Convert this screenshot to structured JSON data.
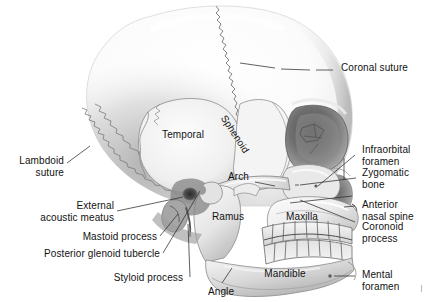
{
  "figure": {
    "background_color": "#ffffff",
    "ink_color": "#121212",
    "bone_light": "#fbfbfb",
    "bone_mid": "#d9d9d9",
    "bone_shadow": "#9a9a9a",
    "bone_dark": "#4a4a4a",
    "suture_color": "#6e6e6e"
  },
  "labels": {
    "coronal_suture": "Coronal suture",
    "temporal": "Temporal",
    "sphenoid": "Sphenoid",
    "arch": "Arch",
    "lambdoid_suture": "Lambdoid\nsuture",
    "external_acoustic_meatus": "External\nacoustic meatus",
    "mastoid_process": "Mastoid process",
    "posterior_glenoid_tubercle": "Posterior glenoid tubercle",
    "styloid_process": "Styloid process",
    "angle": "Angle",
    "ramus": "Ramus",
    "maxilla": "Maxilla",
    "mandible": "Mandible",
    "infraorbital_foramen": "Infraorbital\nforamen",
    "zygomatic_bone": "Zygomatic\nbone",
    "anterior_nasal_spine": "Anterior\nnasal spine",
    "coronoid_process": "Coronoid\nprocess",
    "mental_foramen": "Mental\nforamen"
  },
  "structures": [
    {
      "name": "coronal-suture",
      "type": "suture",
      "side": "superior"
    },
    {
      "name": "lambdoid-suture",
      "type": "suture",
      "side": "posterior"
    },
    {
      "name": "temporal-bone",
      "type": "bone"
    },
    {
      "name": "sphenoid-bone",
      "type": "bone"
    },
    {
      "name": "zygomatic-arch",
      "type": "bone"
    },
    {
      "name": "zygomatic-bone",
      "type": "bone"
    },
    {
      "name": "maxilla",
      "type": "bone"
    },
    {
      "name": "mandible",
      "type": "bone"
    },
    {
      "name": "orbit",
      "type": "cavity"
    },
    {
      "name": "nasal-aperture",
      "type": "cavity"
    },
    {
      "name": "external-acoustic-meatus",
      "type": "cavity"
    },
    {
      "name": "mastoid-process",
      "type": "process"
    },
    {
      "name": "styloid-process",
      "type": "process"
    },
    {
      "name": "coronoid-process",
      "type": "process"
    },
    {
      "name": "posterior-glenoid-tubercle",
      "type": "process"
    },
    {
      "name": "anterior-nasal-spine",
      "type": "process"
    },
    {
      "name": "infraorbital-foramen",
      "type": "foramen"
    },
    {
      "name": "mental-foramen",
      "type": "foramen"
    },
    {
      "name": "upper-teeth-row",
      "type": "teeth",
      "count": 8
    },
    {
      "name": "lower-teeth-row",
      "type": "teeth",
      "count": 8
    }
  ]
}
